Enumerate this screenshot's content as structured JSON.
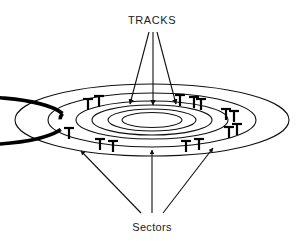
{
  "figure": {
    "title_top": "TRACKS",
    "title_bottom": "Sectors",
    "colors": {
      "ink": "#111111",
      "background": "#ffffff",
      "thick_ring": "#000000"
    }
  },
  "labels": {
    "tracks": "TRACKS",
    "sectors": "Sectors"
  },
  "chart_data": {
    "type": "diagram",
    "title": "TRACKS",
    "view": "perspective-ellipse-platter",
    "center": {
      "cx": 152,
      "cy": 120
    },
    "rings": [
      {
        "name": "platter-edge",
        "rx": 137,
        "ry": 36,
        "stroke": 1.1,
        "role": "outer-boundary"
      },
      {
        "name": "track-outer",
        "rx": 104,
        "ry": 27,
        "stroke": 1.1,
        "role": "track"
      },
      {
        "name": "sector-ring",
        "rx": 92,
        "ry": 24,
        "stroke": 3.4,
        "role": "sectored-track"
      },
      {
        "name": "track-3",
        "rx": 76,
        "ry": 19,
        "stroke": 1.1,
        "role": "track"
      },
      {
        "name": "track-2",
        "rx": 60,
        "ry": 15,
        "stroke": 1.1,
        "role": "track"
      },
      {
        "name": "track-1",
        "rx": 44,
        "ry": 11,
        "stroke": 1.1,
        "role": "track"
      },
      {
        "name": "spindle-hole",
        "rx": 30,
        "ry": 7.5,
        "stroke": 1.1,
        "role": "hub"
      }
    ],
    "sector_marks": {
      "count": 10,
      "style": "I-bar tick perpendicular to ring",
      "angles_deg": [
        20,
        58,
        96,
        134,
        172,
        200,
        238,
        276,
        314,
        352
      ]
    },
    "tracks_arrows": [
      {
        "from": [
          152,
          40
        ],
        "to": [
          129,
          105
        ]
      },
      {
        "from": [
          152,
          40
        ],
        "to": [
          152,
          106
        ]
      },
      {
        "from": [
          152,
          40
        ],
        "to": [
          175,
          105
        ]
      }
    ],
    "sectors_arrows": [
      {
        "from": [
          140,
          212
        ],
        "to": [
          81,
          152
        ]
      },
      {
        "from": [
          152,
          212
        ],
        "to": [
          152,
          150
        ]
      },
      {
        "from": [
          166,
          212
        ],
        "to": [
          212,
          149
        ]
      }
    ],
    "annotations": [
      {
        "text": "TRACKS",
        "x": 152,
        "y": 22,
        "anchor": "middle",
        "points_to": "inner concentric rings"
      },
      {
        "text": "Sectors",
        "x": 152,
        "y": 230,
        "anchor": "middle",
        "points_to": "sector division marks on thick ring"
      }
    ],
    "grid": false,
    "legend": null
  }
}
